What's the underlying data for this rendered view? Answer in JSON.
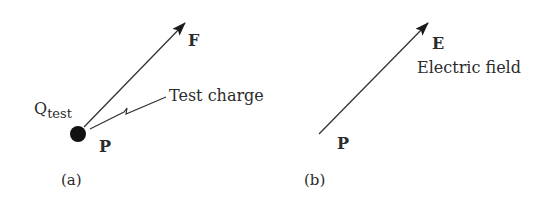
{
  "panel_a": {
    "caption": "(a)",
    "vector_label": "F",
    "point_label": "P",
    "charge_label_main": "Q",
    "charge_label_sub": "test",
    "annotation": "Test charge"
  },
  "panel_b": {
    "caption": "(b)",
    "vector_label": "E",
    "vector_description": "Electric field",
    "point_label": "P"
  },
  "colors": {
    "ink": "#2a2a2a",
    "background": "#ffffff"
  }
}
